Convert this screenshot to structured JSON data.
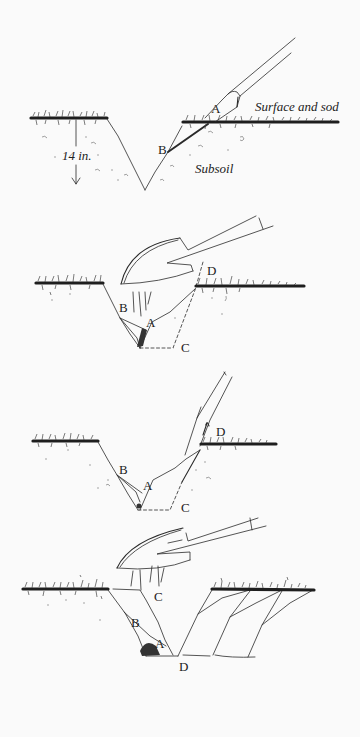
{
  "figure": {
    "background": "#fafafa",
    "ink_color": "#2a2a2a"
  },
  "panels": [
    {
      "step": 1,
      "labels": {
        "surface": "Surface and sod",
        "subsoil": "Subsoil",
        "depth": "14 in.",
        "a": "A",
        "b": "B"
      }
    },
    {
      "step": 2,
      "labels": {
        "a": "A",
        "b": "B",
        "c": "C",
        "d": "D"
      }
    },
    {
      "step": 3,
      "labels": {
        "a": "A",
        "b": "B",
        "c": "C",
        "d": "D"
      }
    },
    {
      "step": 4,
      "labels": {
        "a": "A",
        "b": "B",
        "c": "C",
        "d": "D"
      }
    }
  ]
}
